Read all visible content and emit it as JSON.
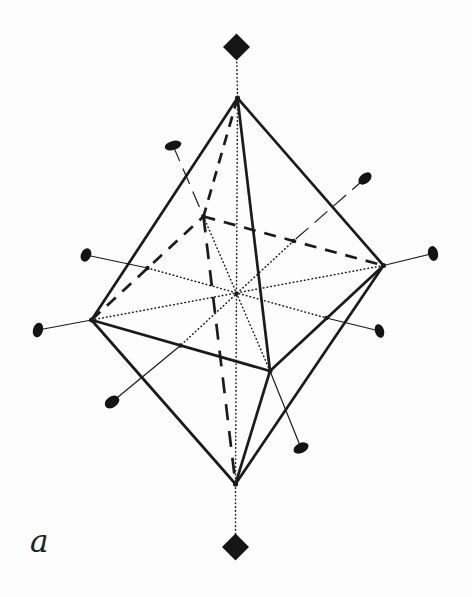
{
  "figure": {
    "label": "a",
    "ink_color": "#1b1b1b",
    "ellipsoid_color": "#141414",
    "diamond_color": "#151515",
    "points": {
      "apex-top": [
        237.5,
        98
      ],
      "apex-bottom": [
        235.5,
        484
      ],
      "eq-left": [
        91.5,
        320
      ],
      "eq-right": [
        383.5,
        265.5
      ],
      "eq-back": [
        203.5,
        216.5
      ],
      "eq-front": [
        270,
        371
      ],
      "center": [
        236.5,
        294
      ],
      "mid-left-back": [
        147.5,
        268
      ],
      "mid-back-right": [
        293.5,
        241
      ],
      "mid-left-front": [
        180.5,
        345.5
      ],
      "mid-front-right": [
        326.5,
        318
      ],
      "diamond-top": [
        236.5,
        47
      ],
      "diamond-bottom": [
        235.5,
        547
      ]
    },
    "edges": [
      {
        "from": "diamond-top",
        "to": "apex-top",
        "style": "dotted"
      },
      {
        "from": "apex-top",
        "to": "apex-bottom",
        "style": "dotted"
      },
      {
        "from": "apex-bottom",
        "to": "diamond-bottom",
        "style": "dotted"
      },
      {
        "from": "eq-left",
        "to": "eq-right",
        "style": "dotted"
      },
      {
        "from": "eq-back",
        "to": "eq-front",
        "style": "dotted"
      },
      {
        "from": "mid-left-back",
        "to": "mid-front-right",
        "style": "dotted"
      },
      {
        "from": "mid-back-right",
        "to": "mid-left-front",
        "style": "dotted"
      },
      {
        "from": "apex-top",
        "to": "eq-back",
        "style": "dashed-bold",
        "dash": "11 8"
      },
      {
        "from": "eq-left",
        "to": "eq-back",
        "style": "dashed-bold",
        "dash": "12 9"
      },
      {
        "from": "eq-back",
        "to": "eq-right",
        "style": "dashed-bold",
        "dash": "12 9"
      },
      {
        "from": "eq-back",
        "to": "apex-bottom",
        "style": "dashed-bold",
        "dash": "16 11"
      },
      {
        "from": "apex-top",
        "to": "eq-left",
        "style": "solid-bold"
      },
      {
        "from": "apex-top",
        "to": "eq-right",
        "style": "solid-bold"
      },
      {
        "from": "apex-top",
        "to": "eq-front",
        "style": "solid-bold"
      },
      {
        "from": "eq-left",
        "to": "eq-front",
        "style": "solid-bold"
      },
      {
        "from": "eq-front",
        "to": "eq-right",
        "style": "solid-bold"
      },
      {
        "from": "apex-bottom",
        "to": "eq-left",
        "style": "solid-bold"
      },
      {
        "from": "apex-bottom",
        "to": "eq-right",
        "style": "solid-bold"
      },
      {
        "from": "apex-bottom",
        "to": "eq-front",
        "style": "solid-bold"
      }
    ],
    "ellipsoids": [
      {
        "name": "ellipsoid-upper-left",
        "cx": 173,
        "cy": 145.5,
        "rx": 8.5,
        "ry": 4.5,
        "rot": -15,
        "bond_to": "eq-back",
        "bond_style": "thin-dashed-mid"
      },
      {
        "name": "ellipsoid-upper-right",
        "cx": 365,
        "cy": 178.5,
        "rx": 7.5,
        "ry": 5,
        "rot": -40,
        "bond_to": "mid-back-right",
        "bond_style": "thin-dashed-mid"
      },
      {
        "name": "ellipsoid-far-right",
        "cx": 433,
        "cy": 253.5,
        "rx": 7.5,
        "ry": 5,
        "rot": 78,
        "bond_to": "eq-right",
        "bond_style": "thin"
      },
      {
        "name": "ellipsoid-mid-left",
        "cx": 86,
        "cy": 255,
        "rx": 7,
        "ry": 5,
        "rot": -65,
        "bond_to": "mid-left-back",
        "bond_style": "thin"
      },
      {
        "name": "ellipsoid-far-left",
        "cx": 38,
        "cy": 330,
        "rx": 7.5,
        "ry": 5,
        "rot": -75,
        "bond_to": "eq-left",
        "bond_style": "thin"
      },
      {
        "name": "ellipsoid-lower-left",
        "cx": 112,
        "cy": 402,
        "rx": 8,
        "ry": 5.5,
        "rot": -35,
        "bond_to": "mid-left-front",
        "bond_style": "thin"
      },
      {
        "name": "ellipsoid-lower-right",
        "cx": 301,
        "cy": 448,
        "rx": 8,
        "ry": 5,
        "rot": -25,
        "bond_to": "eq-front",
        "bond_style": "thin"
      },
      {
        "name": "ellipsoid-right",
        "cx": 379.5,
        "cy": 331,
        "rx": 7,
        "ry": 4.5,
        "rot": 72,
        "bond_to": "mid-front-right",
        "bond_style": "thin"
      }
    ],
    "diamonds": [
      {
        "name": "diamond-top-marker",
        "at": "diamond-top",
        "r": 13.5
      },
      {
        "name": "diamond-bottom-marker",
        "at": "diamond-bottom",
        "r": 13.5
      }
    ],
    "junction_dots": [
      {
        "at": "apex-top",
        "r": 2.6
      },
      {
        "at": "apex-bottom",
        "r": 2.6
      },
      {
        "at": "eq-left",
        "r": 2.5
      },
      {
        "at": "eq-right",
        "r": 2.5
      },
      {
        "at": "eq-back",
        "r": 2.5
      },
      {
        "at": "eq-front",
        "r": 2.5
      },
      {
        "at": "mid-left-back",
        "r": 2.2
      },
      {
        "at": "mid-back-right",
        "r": 2.2
      },
      {
        "at": "mid-left-front",
        "r": 2.2
      },
      {
        "at": "mid-front-right",
        "r": 2.2
      },
      {
        "at": "center",
        "r": 2.0
      }
    ]
  }
}
